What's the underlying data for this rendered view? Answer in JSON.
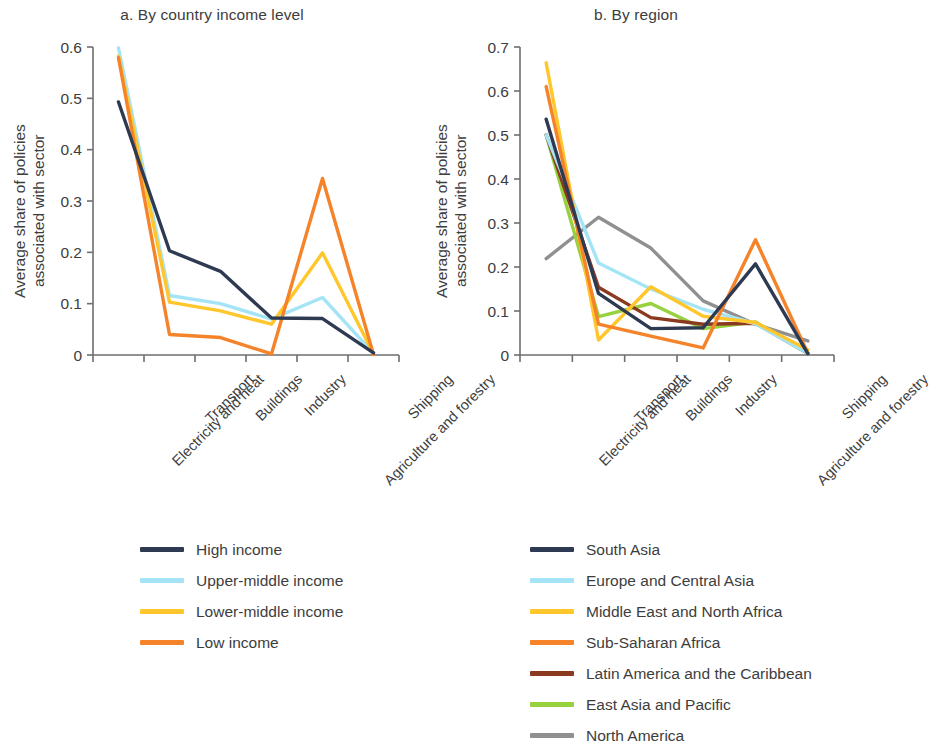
{
  "chart_data": [
    {
      "type": "line",
      "panel_id": "a",
      "title": "a. By country income level",
      "xlabel": "",
      "ylabel": "Average share of policies\nassociated with sector",
      "ylabel_line1": "Average share of policies",
      "ylabel_line2": "associated with sector",
      "categories": [
        "Electricity and heat",
        "Transport",
        "Buildings",
        "Industry",
        "Agriculture and forestry",
        "Shipping"
      ],
      "ylim": [
        0,
        0.6
      ],
      "yticks": [
        0,
        0.1,
        0.2,
        0.3,
        0.4,
        0.5,
        0.6
      ],
      "ytick_labels": [
        "0",
        "0.1",
        "0.2",
        "0.3",
        "0.4",
        "0.5",
        "0.6"
      ],
      "grid": false,
      "legend_position": "bottom",
      "series": [
        {
          "name": "High income",
          "color": "#2e3a52",
          "values": [
            0.493,
            0.203,
            0.163,
            0.072,
            0.071,
            0.004
          ]
        },
        {
          "name": "Upper-middle income",
          "color": "#a5e4f7",
          "values": [
            0.598,
            0.116,
            0.1,
            0.07,
            0.112,
            0.003
          ]
        },
        {
          "name": "Lower-middle income",
          "color": "#ffc72c",
          "values": [
            0.582,
            0.103,
            0.086,
            0.06,
            0.199,
            0.002
          ]
        },
        {
          "name": "Low income",
          "color": "#f5832a",
          "values": [
            0.579,
            0.04,
            0.034,
            0.002,
            0.344,
            0.001
          ]
        }
      ]
    },
    {
      "type": "line",
      "panel_id": "b",
      "title": "b. By region",
      "xlabel": "",
      "ylabel": "Average share of policies\nassociated with sector",
      "ylabel_line1": "Average share of policies",
      "ylabel_line2": "associated with sector",
      "categories": [
        "Electricity and heat",
        "Transport",
        "Buildings",
        "Industry",
        "Agriculture and forestry",
        "Shipping"
      ],
      "ylim": [
        0,
        0.7
      ],
      "yticks": [
        0,
        0.1,
        0.2,
        0.3,
        0.4,
        0.5,
        0.6,
        0.7
      ],
      "ytick_labels": [
        "0",
        "0.1",
        "0.2",
        "0.3",
        "0.4",
        "0.5",
        "0.6",
        "0.7"
      ],
      "grid": false,
      "legend_position": "bottom",
      "series": [
        {
          "name": "South Asia",
          "color": "#2e3a52",
          "values": [
            0.536,
            0.14,
            0.06,
            0.062,
            0.207,
            0.003
          ]
        },
        {
          "name": "Europe and Central Asia",
          "color": "#a5e4f7",
          "values": [
            0.5,
            0.209,
            0.15,
            0.104,
            0.071,
            0.004
          ]
        },
        {
          "name": "Middle East and North Africa",
          "color": "#ffc72c",
          "values": [
            0.664,
            0.034,
            0.155,
            0.088,
            0.074,
            0.012
          ]
        },
        {
          "name": "Sub-Saharan Africa",
          "color": "#f5832a",
          "values": [
            0.61,
            0.07,
            0.043,
            0.016,
            0.262,
            0.004
          ]
        },
        {
          "name": "Latin America and the Caribbean",
          "color": "#8b3a20",
          "values": [
            0.5,
            0.154,
            0.085,
            0.07,
            0.072,
            0.004
          ]
        },
        {
          "name": "East Asia and Pacific",
          "color": "#97d13e",
          "values": [
            0.5,
            0.087,
            0.117,
            0.06,
            0.075,
            0.004
          ]
        },
        {
          "name": "North America",
          "color": "#909090",
          "values": [
            0.219,
            0.313,
            0.243,
            0.123,
            0.07,
            0.032
          ]
        }
      ]
    }
  ]
}
